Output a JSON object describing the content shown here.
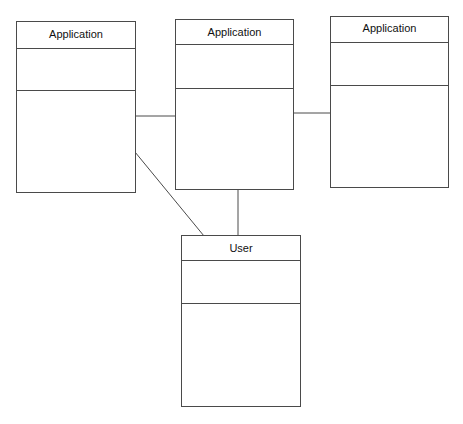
{
  "diagram": {
    "type": "UML class diagram",
    "classes": [
      {
        "id": "app1",
        "name": "Application",
        "attributes": [],
        "operations": []
      },
      {
        "id": "app2",
        "name": "Application",
        "attributes": [],
        "operations": []
      },
      {
        "id": "app3",
        "name": "Application",
        "attributes": [],
        "operations": []
      },
      {
        "id": "user",
        "name": "User",
        "attributes": [],
        "operations": []
      }
    ],
    "associations": [
      {
        "from": "app1",
        "to": "app2"
      },
      {
        "from": "app2",
        "to": "app3"
      },
      {
        "from": "app2",
        "to": "user"
      },
      {
        "from": "app1",
        "to": "user"
      }
    ],
    "colors": {
      "line": "#4a4a4a",
      "background": "#ffffff",
      "text": "#111111"
    }
  }
}
